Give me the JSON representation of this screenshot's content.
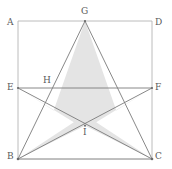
{
  "figure": {
    "canvas": {
      "width": 172,
      "height": 169
    },
    "colors": {
      "background": "#ffffff",
      "square_stroke": "#b4b4b4",
      "star_stroke": "#7a7a7a",
      "star_fill": "#e4e4e4",
      "label_text": "#5a5a5a"
    },
    "stroke_widths": {
      "square": 0.9,
      "star": 0.9
    },
    "square": {
      "name": "ABCD",
      "corners": [
        {
          "id": "A",
          "x": 18,
          "y": 21
        },
        {
          "id": "D",
          "x": 152,
          "y": 21
        },
        {
          "id": "C",
          "x": 152,
          "y": 159
        },
        {
          "id": "B",
          "x": 18,
          "y": 159
        }
      ]
    },
    "segment_EF": {
      "from": "E",
      "to": "F",
      "x1": 18,
      "y1": 88,
      "x2": 152,
      "y2": 88
    },
    "star": {
      "type": "pentagram",
      "outer_points": [
        {
          "id": "G",
          "x": 85,
          "y": 21
        },
        {
          "id": "F",
          "x": 152,
          "y": 88
        },
        {
          "id": "C",
          "x": 152,
          "y": 159
        },
        {
          "id": "B",
          "x": 18,
          "y": 159
        },
        {
          "id": "E",
          "x": 18,
          "y": 88
        }
      ],
      "chords": [
        {
          "from": "G",
          "to": "B"
        },
        {
          "from": "G",
          "to": "C"
        },
        {
          "from": "E",
          "to": "C"
        },
        {
          "from": "F",
          "to": "B"
        },
        {
          "from": "E",
          "to": "F"
        }
      ],
      "outline_path": "M 85 21 L 116.3 110.6 L 152 88 L 96.2 122.3 L 152 159 L 85 125.7 L 18 159 L 73.8 122.3 L 18 88 L 53.7 110.6 Z"
    },
    "points": [
      {
        "id": "A",
        "x": 18,
        "y": 21,
        "label": "A",
        "label_x": 7,
        "label_y": 18,
        "kind": "square-corner",
        "dot": false
      },
      {
        "id": "D",
        "x": 152,
        "y": 21,
        "label": "D",
        "label_x": 155,
        "label_y": 18,
        "kind": "square-corner",
        "dot": false
      },
      {
        "id": "B",
        "x": 18,
        "y": 159,
        "label": "B",
        "label_x": 7,
        "label_y": 156,
        "kind": "star-point",
        "dot": true
      },
      {
        "id": "C",
        "x": 152,
        "y": 159,
        "label": "C",
        "label_x": 155,
        "label_y": 156,
        "kind": "star-point",
        "dot": true
      },
      {
        "id": "E",
        "x": 18,
        "y": 88,
        "label": "E",
        "label_x": 7,
        "label_y": 84,
        "kind": "star-point",
        "dot": true
      },
      {
        "id": "F",
        "x": 152,
        "y": 88,
        "label": "F",
        "label_x": 155,
        "label_y": 84,
        "kind": "star-point",
        "dot": true
      },
      {
        "id": "G",
        "x": 85,
        "y": 21,
        "label": "G",
        "label_x": 81,
        "label_y": 8,
        "kind": "star-apex",
        "dot": true
      },
      {
        "id": "H",
        "x": 53.7,
        "y": 88,
        "label": "H",
        "label_x": 43,
        "label_y": 77,
        "kind": "intersection",
        "dot": false
      },
      {
        "id": "I",
        "x": 85,
        "y": 125.7,
        "label": "I",
        "label_x": 83,
        "label_y": 129,
        "kind": "intersection",
        "dot": true
      }
    ]
  }
}
